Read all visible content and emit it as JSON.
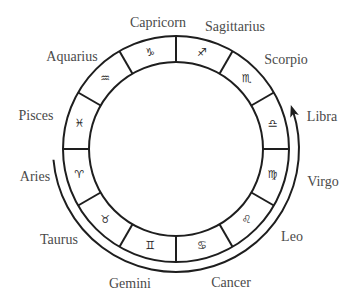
{
  "diagram": {
    "center": [
      176,
      149
    ],
    "outer_radius": 113,
    "inner_radius": 87,
    "arrow_radius": 123,
    "colors": {
      "stroke": "#1e1e1e",
      "text": "#4a4a4a",
      "background": "#ffffff"
    },
    "signs": [
      {
        "name": "Capricorn",
        "symbol": "♑",
        "label_pos": [
          158,
          23
        ],
        "glyph_angle": 105
      },
      {
        "name": "Sagittarius",
        "symbol": "♐",
        "label_pos": [
          235,
          27
        ],
        "glyph_angle": 75
      },
      {
        "name": "Scorpio",
        "symbol": "♏",
        "label_pos": [
          286,
          60
        ],
        "glyph_angle": 45
      },
      {
        "name": "Libra",
        "symbol": "♎",
        "label_pos": [
          322,
          117
        ],
        "glyph_angle": 15
      },
      {
        "name": "Virgo",
        "symbol": "♍",
        "label_pos": [
          323,
          182
        ],
        "glyph_angle": -15
      },
      {
        "name": "Leo",
        "symbol": "♌",
        "label_pos": [
          292,
          237
        ],
        "glyph_angle": -45
      },
      {
        "name": "Cancer",
        "symbol": "♋",
        "label_pos": [
          231,
          283
        ],
        "glyph_angle": -75
      },
      {
        "name": "Gemini",
        "symbol": "♊",
        "label_pos": [
          130,
          284
        ],
        "glyph_angle": -105
      },
      {
        "name": "Taurus",
        "symbol": "♉",
        "label_pos": [
          59,
          240
        ],
        "glyph_angle": -135
      },
      {
        "name": "Aries",
        "symbol": "♈",
        "label_pos": [
          35,
          177
        ],
        "glyph_angle": -165
      },
      {
        "name": "Pisces",
        "symbol": "♓",
        "label_pos": [
          36,
          116
        ],
        "glyph_angle": 165
      },
      {
        "name": "Aquarius",
        "symbol": "♒",
        "label_pos": [
          72,
          57
        ],
        "glyph_angle": 135
      }
    ],
    "arrow": {
      "description": "Curved arrow running outside the wheel from Aries, down past Taurus, Gemini, Cancer, Leo, Virgo, and pointing up at Libra",
      "start_angle": 185,
      "end_angle": 18
    }
  }
}
